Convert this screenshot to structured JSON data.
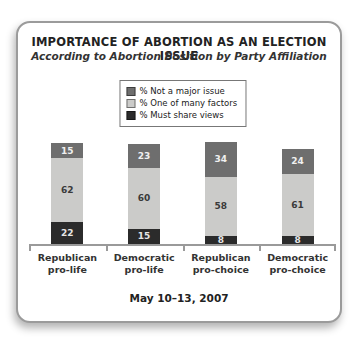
{
  "header": {
    "title": "IMPORTANCE OF ABORTION AS AN ELECTION ISSUE",
    "subtitle": "According to Abortion Position by Party Affiliation"
  },
  "chart_data": {
    "type": "bar",
    "stacked": true,
    "title": "IMPORTANCE OF ABORTION AS AN ELECTION ISSUE",
    "subtitle": "According to Abortion Position by Party Affiliation",
    "categories": [
      [
        "Republican",
        "pro-life"
      ],
      [
        "Democratic",
        "pro-life"
      ],
      [
        "Republican",
        "pro-choice"
      ],
      [
        "Democratic",
        "pro-choice"
      ]
    ],
    "series": [
      {
        "name": "% Not a major issue",
        "color": "#6e6e6e",
        "label_color": "#f0f0f0",
        "values": [
          15,
          23,
          34,
          24
        ]
      },
      {
        "name": "% One of many factors",
        "color": "#cbcbc9",
        "label_color": "#3a3a3a",
        "values": [
          62,
          60,
          58,
          61
        ]
      },
      {
        "name": "% Must share views",
        "color": "#2b2b2b",
        "label_color": "#e6e6e6",
        "values": [
          22,
          15,
          8,
          8
        ]
      }
    ],
    "ylim": [
      0,
      100
    ],
    "unit": "%",
    "grid": false,
    "legend_position": "top-center",
    "axis_color": "#9a9a9a"
  },
  "footer": {
    "date_label": "May 10–13, 2007"
  }
}
